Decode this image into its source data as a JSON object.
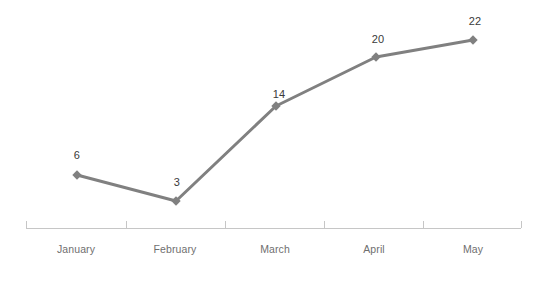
{
  "chart_data": {
    "type": "line",
    "title": "",
    "subtitle": "",
    "xlabel": "",
    "ylabel": "",
    "categories": [
      "January",
      "February",
      "March",
      "April",
      "May"
    ],
    "values": [
      6,
      3,
      14,
      20,
      22
    ],
    "series": [
      {
        "name": "Series 1",
        "values": [
          6,
          3,
          14,
          20,
          22
        ]
      }
    ],
    "data_labels": [
      "6",
      "3",
      "14",
      "20",
      "22"
    ],
    "data_labels_visible": true,
    "ylim": [
      0,
      22
    ],
    "grid": false,
    "legend": false,
    "legend_position": "none",
    "y_axis_visible": false,
    "x_axis_visible": true,
    "marker": "diamond",
    "colors": {
      "line": "#808080",
      "marker": "#808080",
      "axis": "#c6c6c6",
      "data_label_text": "#3a3a3a",
      "category_label_text": "#6f6f6f",
      "background": "#ffffff"
    },
    "geometry": {
      "axis_y": 228,
      "axis_x_start": 26,
      "axis_x_end": 521,
      "tick_positions": [
        26,
        126,
        225,
        324,
        423,
        521
      ],
      "tick_length": 7,
      "line_width": 3,
      "marker_size": 7,
      "points": [
        {
          "x": 77,
          "y": 175
        },
        {
          "x": 176,
          "y": 201
        },
        {
          "x": 276,
          "y": 106
        },
        {
          "x": 376,
          "y": 57
        },
        {
          "x": 473,
          "y": 40
        }
      ],
      "label_positions": [
        {
          "x": 77,
          "y": 155
        },
        {
          "x": 177,
          "y": 182
        },
        {
          "x": 279,
          "y": 94
        },
        {
          "x": 378,
          "y": 39
        },
        {
          "x": 475,
          "y": 21
        }
      ],
      "category_label_positions": [
        {
          "x": 76,
          "y": 243
        },
        {
          "x": 175,
          "y": 243
        },
        {
          "x": 275,
          "y": 243
        },
        {
          "x": 374,
          "y": 243
        },
        {
          "x": 473,
          "y": 243
        }
      ]
    }
  }
}
